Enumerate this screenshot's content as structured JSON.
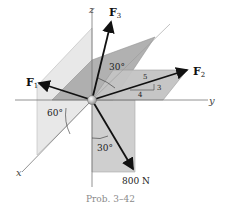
{
  "figure": {
    "caption": "Prob. 3–42",
    "axes": {
      "x": "x",
      "y": "y",
      "z": "z"
    },
    "forces": {
      "F1": {
        "label": "F",
        "sub": "1"
      },
      "F2": {
        "label": "F",
        "sub": "2"
      },
      "F3": {
        "label": "F",
        "sub": "3"
      },
      "F4": {
        "label": "800 N"
      }
    },
    "angles": {
      "f3_from_z": "30°",
      "f1_plane": "60°",
      "f4_from_neg_z": "30°"
    },
    "slope_triangle": {
      "hyp": "5",
      "rise": "3",
      "run": "4"
    },
    "colors": {
      "plane_light": "#e6e6e6",
      "plane_mid": "#bdbdbd",
      "plane_dark": "#a6a6a6",
      "arrow": "#111111",
      "axis": "#777777",
      "caption": "#8a8a8a"
    }
  }
}
